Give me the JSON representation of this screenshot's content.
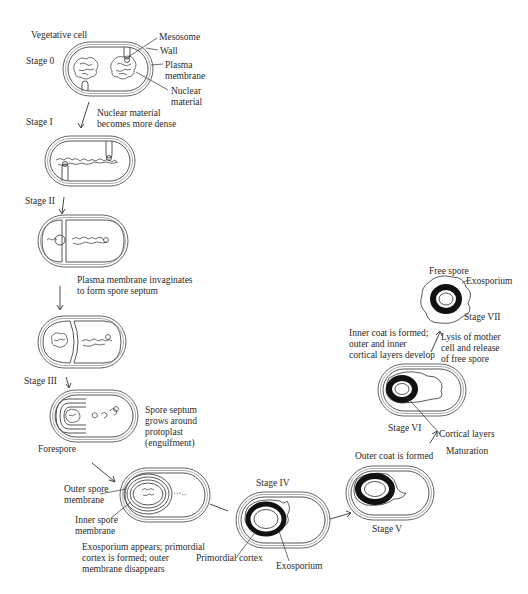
{
  "figure": {
    "colors": {
      "background": "#ffffff",
      "ink": "#222222",
      "cortex": "#111111"
    }
  },
  "stages": [
    {
      "id": "stage-0",
      "label": "Stage 0",
      "header": "Vegetative cell"
    },
    {
      "id": "stage-1",
      "label": "Stage I",
      "description": "Nuclear material\nbecomes more dense"
    },
    {
      "id": "stage-2",
      "label": "Stage II",
      "description": "Plasma membrane invaginates\nto form spore septum"
    },
    {
      "id": "stage-3",
      "label": "Stage III",
      "description": "Spore septum\ngrows around\nprotoplast\n(engulfment)"
    },
    {
      "id": "stage-4",
      "label": "Stage IV",
      "description": "Exosporium appears; primordial\ncortex is formed; outer\nmembrane disappears"
    },
    {
      "id": "stage-5",
      "label": "Stage V",
      "description": "Outer coat is formed"
    },
    {
      "id": "stage-6",
      "label": "Stage VI",
      "description": "Inner coat is formed;\nouter and inner\ncortical layers develop"
    },
    {
      "id": "stage-7",
      "label": "Stage VII",
      "header": "Free spore",
      "description": "Lysis of mother\ncell and release\nof free spore"
    }
  ],
  "annotations": {
    "mesosome": "Mesosome",
    "wall": "Wall",
    "plasma_membrane": "Plasma\nmembrane",
    "nuclear_material": "Nuclear\nmaterial",
    "forespore": "Forespore",
    "outer_spore_membrane": "Outer spore\nmembrane",
    "inner_spore_membrane": "Inner spore\nmembrane",
    "primordial_cortex": "Primordial cortex",
    "exosporium_iv": "Exosporium",
    "cortical_layers": "Cortical layers",
    "maturation": "Maturation",
    "exosporium_vii": "Exosporium"
  }
}
